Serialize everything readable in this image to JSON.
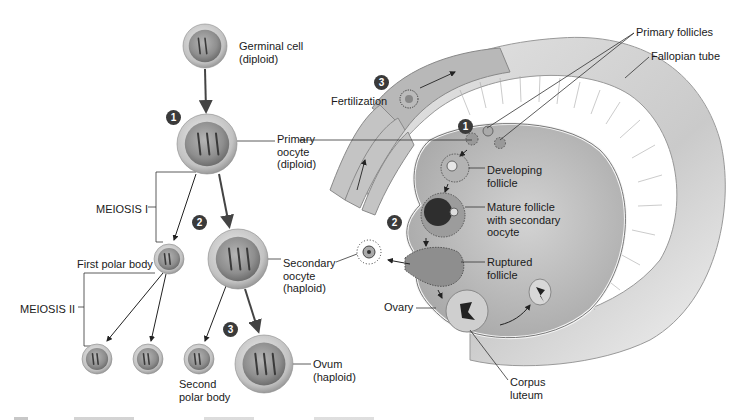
{
  "figure": {
    "type": "oogenesis-diagram",
    "left_panel": {
      "cells": [
        {
          "id": "germinal-cell",
          "cx": 205,
          "cy": 46,
          "r": 22,
          "label": "Germinal cell\n(diploid)",
          "label_x": 239,
          "label_y": 40
        },
        {
          "id": "primary-oocyte",
          "cx": 207,
          "cy": 144,
          "r": 30,
          "label": "Primary\noocyte\n(diploid)",
          "label_x": 277,
          "label_y": 133
        },
        {
          "id": "first-polar-body",
          "cx": 169,
          "cy": 259,
          "r": 15,
          "label": "First polar body",
          "label_x": 77,
          "label_y": 258
        },
        {
          "id": "secondary-oocyte",
          "cx": 238,
          "cy": 259,
          "r": 30,
          "label": "Secondary\noocyte\n(haploid)",
          "label_x": 283,
          "label_y": 257
        },
        {
          "id": "polar-body-a",
          "cx": 97,
          "cy": 359,
          "r": 15
        },
        {
          "id": "polar-body-b",
          "cx": 148,
          "cy": 359,
          "r": 15
        },
        {
          "id": "second-polar-body",
          "cx": 199,
          "cy": 359,
          "r": 15,
          "label": "Second\npolar body",
          "label_x": 179,
          "label_y": 378
        },
        {
          "id": "ovum",
          "cx": 264,
          "cy": 364,
          "r": 29,
          "label": "Ovum\n(haploid)",
          "label_x": 313,
          "label_y": 358
        }
      ],
      "brackets": [
        {
          "id": "meiosis-1",
          "label": "MEIOSIS I",
          "label_x": 96,
          "label_y": 203
        },
        {
          "id": "meiosis-2",
          "label": "MEIOSIS II",
          "label_x": 20,
          "label_y": 303
        }
      ],
      "steps": [
        {
          "n": "1",
          "x": 166,
          "y": 110
        },
        {
          "n": "2",
          "x": 192,
          "y": 215
        },
        {
          "n": "3",
          "x": 223,
          "y": 322
        }
      ]
    },
    "right_panel": {
      "labels": [
        {
          "id": "primary-follicles",
          "text": "Primary follicles",
          "x": 636,
          "y": 26
        },
        {
          "id": "fallopian-tube",
          "text": "Fallopian tube",
          "x": 651,
          "y": 50
        },
        {
          "id": "fertilization",
          "text": "Fertilization",
          "x": 331,
          "y": 95
        },
        {
          "id": "developing-follicle",
          "text": "Developing\nfollicle",
          "x": 487,
          "y": 164
        },
        {
          "id": "mature-follicle",
          "text": "Mature follicle\nwith secondary\noocyte",
          "x": 487,
          "y": 201
        },
        {
          "id": "ruptured-follicle",
          "text": "Ruptured\nfollicle",
          "x": 487,
          "y": 256
        },
        {
          "id": "ovary",
          "text": "Ovary",
          "x": 384,
          "y": 301
        },
        {
          "id": "corpus-luteum",
          "text": "Corpus\nluteum",
          "x": 510,
          "y": 376
        }
      ],
      "steps": [
        {
          "n": "3",
          "x": 374,
          "y": 75
        },
        {
          "n": "1",
          "x": 458,
          "y": 119
        },
        {
          "n": "2",
          "x": 387,
          "y": 215
        }
      ]
    },
    "colors": {
      "cell_fill": "#9a9a9a",
      "cell_rim": "#c8c8c8",
      "tube": "#cfcfcf",
      "ovary": "#bdbdbd",
      "ink": "#1a1a1a",
      "step_badge": "#3a3a3a"
    }
  }
}
